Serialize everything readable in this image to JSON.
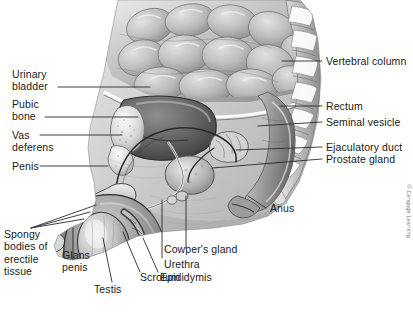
{
  "figure": {
    "width": 413,
    "height": 320,
    "background_color": "#ffffff",
    "line_color": "#2b2b2b",
    "text_color": "#1a1a1a",
    "credit": "© Cengage Learning"
  },
  "labels": {
    "urinary_bladder": "Urinary\nbladder",
    "pubic_bone": "Pubic\nbone",
    "vas_deferens": "Vas\ndeferens",
    "penis": "Penis",
    "spongy_bodies": "Spongy\nbodies of\nerectile\ntissue",
    "glans_penis": "Glans\npenis",
    "testis": "Testis",
    "scrotum": "Scrotum",
    "epididymis": "Epididymis",
    "urethra": "Urethra",
    "cowpers_gland": "Cowper's gland",
    "anus": "Anus",
    "vertebral_column": "Vertebral column",
    "rectum": "Rectum",
    "seminal_vesicle": "Seminal vesicle",
    "ejaculatory_duct": "Ejaculatory duct",
    "prostate_gland": "Prostate gland"
  }
}
